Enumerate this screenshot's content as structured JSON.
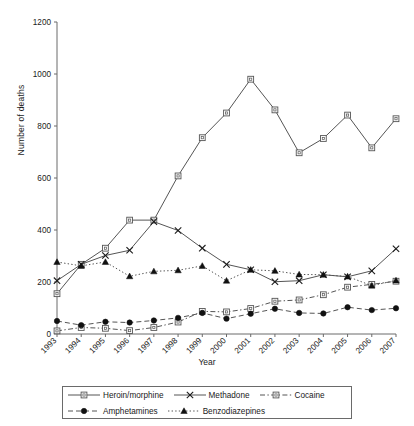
{
  "chart_data": {
    "type": "line",
    "title": "",
    "xlabel": "Year",
    "ylabel": "Number of deaths",
    "categories": [
      "1993",
      "1994",
      "1995",
      "1996",
      "1997",
      "1998",
      "1999",
      "2000",
      "2001",
      "2002",
      "2003",
      "2004",
      "2005",
      "2006",
      "2007"
    ],
    "x": [
      1993,
      1994,
      1995,
      1996,
      1997,
      1998,
      1999,
      2000,
      2001,
      2002,
      2003,
      2004,
      2005,
      2006,
      2007
    ],
    "ylim": [
      0,
      1200
    ],
    "yticks": [
      0,
      200,
      400,
      600,
      800,
      1000,
      1200
    ],
    "grid": false,
    "legend_position": "bottom",
    "series": [
      {
        "name": "Heroin/morphine",
        "marker": "open-square",
        "line": "solid",
        "values": [
          155,
          268,
          330,
          438,
          438,
          608,
          755,
          850,
          980,
          862,
          697,
          752,
          842,
          716,
          828
        ]
      },
      {
        "name": "Methadone",
        "marker": "cross",
        "line": "solid",
        "values": [
          205,
          268,
          302,
          322,
          432,
          398,
          330,
          268,
          247,
          201,
          205,
          228,
          220,
          243,
          328
        ]
      },
      {
        "name": "Cocaine",
        "marker": "open-square",
        "line": "dash-dot",
        "values": [
          12,
          25,
          22,
          13,
          25,
          46,
          87,
          85,
          98,
          126,
          131,
          151,
          180,
          191,
          203
        ]
      },
      {
        "name": "Amphetamines",
        "marker": "filled-circle",
        "line": "dashed",
        "values": [
          50,
          34,
          47,
          44,
          52,
          62,
          81,
          59,
          78,
          97,
          81,
          79,
          103,
          92,
          99
        ]
      },
      {
        "name": "Benzodiazepines",
        "marker": "filled-triangle",
        "line": "dotted",
        "values": [
          277,
          262,
          277,
          222,
          241,
          245,
          262,
          205,
          247,
          243,
          229,
          228,
          221,
          186,
          206
        ]
      }
    ]
  },
  "axes": {
    "y_tick_labels": [
      "0",
      "200",
      "400",
      "600",
      "800",
      "1000",
      "1200"
    ],
    "x_tick_labels": [
      "1993",
      "1994",
      "1995",
      "1996",
      "1997",
      "1998",
      "1999",
      "2000",
      "2001",
      "2002",
      "2003",
      "2004",
      "2005",
      "2006",
      "2007"
    ],
    "x_axis_title": "Year",
    "y_axis_title": "Number of deaths"
  },
  "legend": {
    "row1": [
      {
        "label": "Heroin/morphine",
        "marker": "open-square",
        "line": "solid"
      },
      {
        "label": "Methadone",
        "marker": "cross",
        "line": "solid"
      },
      {
        "label": "Cocaine",
        "marker": "open-square",
        "line": "dash-dot"
      }
    ],
    "row2": [
      {
        "label": "Amphetamines",
        "marker": "filled-circle",
        "line": "dashed"
      },
      {
        "label": "Benzodiazepines",
        "marker": "filled-triangle",
        "line": "dotted"
      }
    ]
  },
  "colors": {
    "ink": "#1a1a1a",
    "axis": "#6a6a6a",
    "series_line": "#555555",
    "background": "#ffffff"
  }
}
